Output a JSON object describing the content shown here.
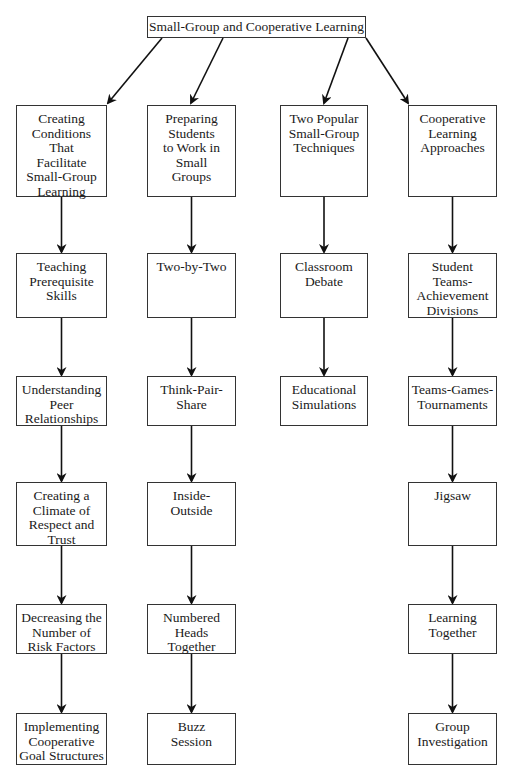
{
  "diagram": {
    "root": {
      "id": "root",
      "label": "Small-Group and Cooperative Learning"
    },
    "columns": [
      {
        "id": "c1",
        "header": "Creating\nConditions\nThat\nFacilitate\nSmall-Group\nLearning",
        "items": [
          "Teaching\nPrerequisite\nSkills",
          "Understanding\nPeer\nRelationships",
          "Creating a\nClimate of\nRespect and\nTrust",
          "Decreasing the\nNumber of\nRisk Factors",
          "Implementing\nCooperative\nGoal Structures"
        ]
      },
      {
        "id": "c2",
        "header": "Preparing\nStudents\nto Work in\nSmall\nGroups",
        "items": [
          "Two-by-Two",
          "Think-Pair-\nShare",
          "Inside-\nOutside",
          "Numbered\nHeads\nTogether",
          "Buzz\nSession"
        ]
      },
      {
        "id": "c3",
        "header": "Two Popular\nSmall-Group\nTechniques",
        "items": [
          "Classroom\nDebate",
          "Educational\nSimulations"
        ]
      },
      {
        "id": "c4",
        "header": "Cooperative\nLearning\nApproaches",
        "items": [
          "Student\nTeams-\nAchievement\nDivisions",
          "Teams-Games-\nTournaments",
          "Jigsaw",
          "Learning\nTogether",
          "Group\nInvestigation"
        ]
      }
    ],
    "edges": "root → each column header; each column flows top-to-bottom through its items"
  }
}
